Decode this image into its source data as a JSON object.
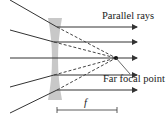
{
  "diagram": {
    "labels": {
      "parallel_rays": "Parallel rays",
      "far_focal_point": "Far focal point",
      "focal_length": "f"
    },
    "colors": {
      "lens": "#c8c8c8",
      "ray": "#333333",
      "dashed": "#444444"
    }
  }
}
